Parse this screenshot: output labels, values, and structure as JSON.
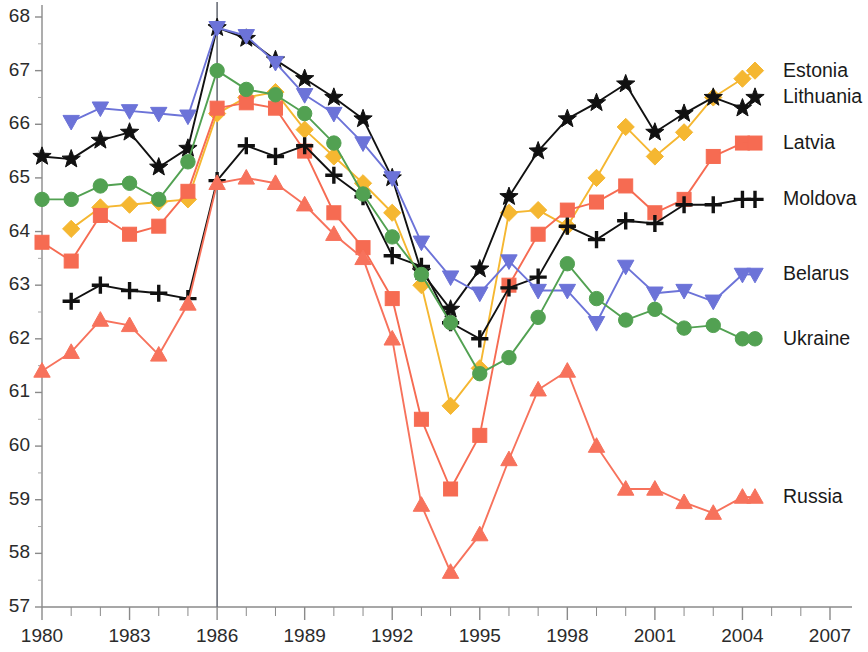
{
  "chart_data": {
    "type": "line",
    "title": "",
    "xlabel": "",
    "ylabel": "",
    "xlim": [
      1980,
      2007
    ],
    "ylim": [
      57,
      68
    ],
    "grid": false,
    "legend_position": "right",
    "x_ticks": [
      "1980",
      "1983",
      "1986",
      "1989",
      "1992",
      "1995",
      "1998",
      "2001",
      "2004",
      "2007"
    ],
    "x_tick_values": [
      1980,
      1983,
      1986,
      1989,
      1992,
      1995,
      1998,
      2001,
      2004,
      2007
    ],
    "x_minor_step": 1,
    "y_ticks": [
      "57",
      "58",
      "59",
      "60",
      "61",
      "62",
      "63",
      "64",
      "65",
      "66",
      "67",
      "68"
    ],
    "y_tick_values": [
      57,
      58,
      59,
      60,
      61,
      62,
      63,
      64,
      65,
      66,
      67,
      68
    ],
    "annotations": [
      {
        "name": "vertical-marker-1986",
        "x": 1986,
        "label": ""
      }
    ],
    "series": [
      {
        "name": "Estonia",
        "color": "#F5B731",
        "marker": "diamond",
        "label_y": 67.0,
        "x": [
          1981,
          1982,
          1983,
          1984,
          1985,
          1986,
          1987,
          1988,
          1989,
          1990,
          1991,
          1992,
          1993,
          1994,
          1995,
          1996,
          1997,
          1998,
          1999,
          2000,
          2001,
          2002,
          2003,
          2004
        ],
        "values": [
          64.05,
          64.45,
          64.5,
          64.55,
          64.6,
          66.2,
          66.5,
          66.6,
          65.9,
          65.4,
          64.9,
          64.35,
          63.0,
          60.75,
          61.45,
          64.35,
          64.4,
          64.1,
          65.0,
          65.95,
          65.4,
          65.85,
          66.5,
          66.85
        ]
      },
      {
        "name": "Lithuania",
        "color": "#111111",
        "marker": "star",
        "label_y": 66.5,
        "x": [
          1980,
          1981,
          1982,
          1983,
          1984,
          1985,
          1986,
          1987,
          1988,
          1989,
          1990,
          1991,
          1992,
          1993,
          1994,
          1995,
          1996,
          1997,
          1998,
          1999,
          2000,
          2001,
          2002,
          2003,
          2004
        ],
        "values": [
          65.4,
          65.35,
          65.7,
          65.85,
          65.2,
          65.55,
          67.8,
          67.6,
          67.2,
          66.85,
          66.5,
          66.1,
          65.0,
          63.25,
          62.55,
          63.3,
          64.65,
          65.5,
          66.1,
          66.4,
          66.75,
          65.85,
          66.2,
          66.5,
          66.3
        ]
      },
      {
        "name": "Latvia",
        "color": "#F66B52",
        "marker": "square",
        "label_y": 65.65,
        "x": [
          1980,
          1981,
          1982,
          1983,
          1984,
          1985,
          1986,
          1987,
          1988,
          1989,
          1990,
          1991,
          1992,
          1993,
          1994,
          1995,
          1996,
          1997,
          1998,
          1999,
          2000,
          2001,
          2002,
          2003,
          2004
        ],
        "values": [
          63.8,
          63.45,
          64.3,
          63.95,
          64.1,
          64.75,
          66.3,
          66.4,
          66.3,
          65.5,
          64.35,
          63.7,
          62.75,
          60.5,
          59.2,
          60.2,
          63.0,
          63.95,
          64.4,
          64.55,
          64.85,
          64.35,
          64.6,
          65.4,
          65.65
        ]
      },
      {
        "name": "Moldova",
        "color": "#111111",
        "marker": "plus",
        "label_y": 64.6,
        "x": [
          1981,
          1982,
          1983,
          1984,
          1985,
          1986,
          1987,
          1988,
          1989,
          1990,
          1991,
          1992,
          1993,
          1994,
          1995,
          1996,
          1997,
          1998,
          1999,
          2000,
          2001,
          2002,
          2003,
          2004
        ],
        "values": [
          62.7,
          63.0,
          62.9,
          62.85,
          62.75,
          64.95,
          65.6,
          65.4,
          65.6,
          65.05,
          64.65,
          63.55,
          63.35,
          62.3,
          62.0,
          62.95,
          63.15,
          64.1,
          63.85,
          64.2,
          64.15,
          64.5,
          64.5,
          64.6
        ]
      },
      {
        "name": "Belarus",
        "color": "#6C73D8",
        "marker": "triangle-down",
        "label_y": 63.2,
        "x": [
          1981,
          1982,
          1983,
          1984,
          1985,
          1986,
          1987,
          1988,
          1989,
          1990,
          1991,
          1992,
          1993,
          1994,
          1995,
          1996,
          1997,
          1998,
          1999,
          2000,
          2001,
          2002,
          2003,
          2004
        ],
        "values": [
          66.05,
          66.3,
          66.25,
          66.2,
          66.15,
          67.8,
          67.65,
          67.15,
          66.55,
          66.2,
          65.65,
          65.0,
          63.8,
          63.15,
          62.85,
          63.45,
          62.9,
          62.9,
          62.3,
          63.35,
          62.85,
          62.9,
          62.7,
          63.2
        ]
      },
      {
        "name": "Ukraine",
        "color": "#52A152",
        "marker": "circle",
        "label_y": 62.0,
        "x": [
          1980,
          1981,
          1982,
          1983,
          1984,
          1985,
          1986,
          1987,
          1988,
          1989,
          1990,
          1991,
          1992,
          1993,
          1994,
          1995,
          1996,
          1997,
          1998,
          1999,
          2000,
          2001,
          2002,
          2003,
          2004
        ],
        "values": [
          64.6,
          64.6,
          64.85,
          64.9,
          64.6,
          65.3,
          67.0,
          66.65,
          66.55,
          66.2,
          65.65,
          64.7,
          63.9,
          63.2,
          62.3,
          61.35,
          61.65,
          62.4,
          63.4,
          62.75,
          62.35,
          62.55,
          62.2,
          62.25,
          62.0
        ]
      },
      {
        "name": "Russia",
        "color": "#F7725C",
        "marker": "triangle-up",
        "label_y": 59.05,
        "x": [
          1980,
          1981,
          1982,
          1983,
          1984,
          1985,
          1986,
          1987,
          1988,
          1989,
          1990,
          1991,
          1992,
          1993,
          1994,
          1995,
          1996,
          1997,
          1998,
          1999,
          2000,
          2001,
          2002,
          2003,
          2004
        ],
        "values": [
          61.4,
          61.75,
          62.35,
          62.25,
          61.7,
          62.65,
          64.9,
          65.0,
          64.9,
          64.5,
          63.95,
          63.5,
          62.0,
          58.9,
          57.65,
          58.35,
          59.75,
          61.05,
          61.4,
          60.0,
          59.2,
          59.2,
          58.95,
          58.75,
          59.05
        ]
      }
    ]
  },
  "legend": {
    "items": [
      {
        "label": "Estonia"
      },
      {
        "label": "Lithuania"
      },
      {
        "label": "Latvia"
      },
      {
        "label": "Moldova"
      },
      {
        "label": "Belarus"
      },
      {
        "label": "Ukraine"
      },
      {
        "label": "Russia"
      }
    ]
  }
}
